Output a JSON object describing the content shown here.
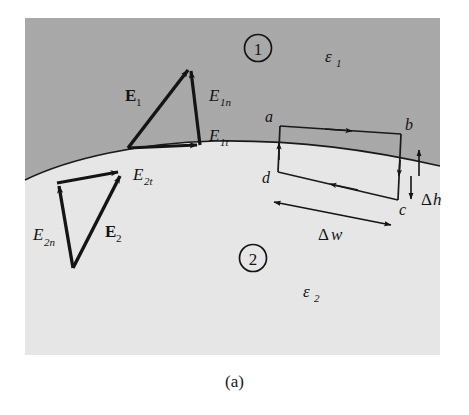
{
  "figure": {
    "caption": "(a)",
    "colors": {
      "region1_fill": "#a9a9a9",
      "region2_fill": "#e7e7e7",
      "page_background": "#ffffff",
      "ink": "#141414",
      "boundary_line": "#1a1a1a"
    }
  },
  "regions": [
    {
      "id": "region-1",
      "marker": "1",
      "permittivity": "ε",
      "permittivity_sub": "1",
      "description": "upper medium"
    },
    {
      "id": "region-2",
      "marker": "2",
      "permittivity": "ε",
      "permittivity_sub": "2",
      "description": "lower medium"
    }
  ],
  "vectors": {
    "upper": [
      {
        "id": "E1",
        "base": "E",
        "sub": "1",
        "bold": true,
        "role": "total field in medium 1"
      },
      {
        "id": "E1n",
        "base": "E",
        "sub": "1n",
        "bold": false,
        "role": "normal component, medium 1"
      },
      {
        "id": "E1t",
        "base": "E",
        "sub": "1t",
        "bold": false,
        "role": "tangential component, medium 1"
      }
    ],
    "lower": [
      {
        "id": "E2",
        "base": "E",
        "sub": "2",
        "bold": true,
        "role": "total field in medium 2"
      },
      {
        "id": "E2n",
        "base": "E",
        "sub": "2n",
        "bold": false,
        "role": "normal component, medium 2"
      },
      {
        "id": "E2t",
        "base": "E",
        "sub": "2t",
        "bold": false,
        "role": "tangential component, medium 2"
      }
    ]
  },
  "loop": {
    "corner_labels": [
      "a",
      "b",
      "c",
      "d"
    ],
    "circulation": "clockwise a-b-c-d-a",
    "dimensions": [
      {
        "id": "dw",
        "symbol": "Δ",
        "name": "w",
        "orientation": "horizontal",
        "role": "loop width"
      },
      {
        "id": "dh",
        "symbol": "Δ",
        "name": "h",
        "orientation": "vertical",
        "role": "loop height"
      }
    ]
  }
}
